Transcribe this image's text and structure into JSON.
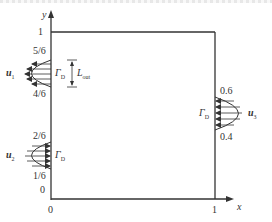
{
  "diagram": {
    "type": "flow-domain-boundary-conditions",
    "axes": {
      "x_label": "x",
      "y_label": "y",
      "origin_x_tick": "0",
      "origin_y_tick": "0",
      "x_max_tick": "1",
      "y_max_tick": "1"
    },
    "inlet_top": {
      "velocity_label": "u",
      "velocity_subscript": "1",
      "upper_tick": "5/6",
      "lower_tick": "4/6",
      "boundary_label": "Γ",
      "boundary_subscript": "D",
      "length_label": "L",
      "length_subscript": "out"
    },
    "inlet_bottom": {
      "velocity_label": "u",
      "velocity_subscript": "2",
      "upper_tick": "2/6",
      "lower_tick": "1/6",
      "boundary_label": "Γ",
      "boundary_subscript": "D"
    },
    "outlet_right": {
      "velocity_label": "u",
      "velocity_subscript": "3",
      "upper_tick": "0.6",
      "lower_tick": "0.4",
      "boundary_label": "Γ",
      "boundary_subscript": "D"
    },
    "colors": {
      "line": "#333333",
      "background": "#ffffff"
    }
  }
}
